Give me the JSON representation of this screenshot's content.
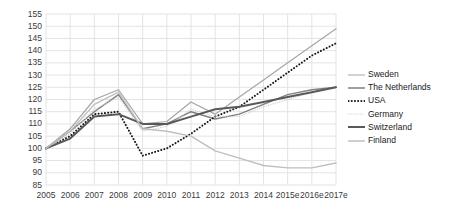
{
  "chart_data": {
    "type": "line",
    "title": "",
    "xlabel": "",
    "ylabel": "",
    "grid": true,
    "legend_position": "right",
    "ylim": [
      85,
      155
    ],
    "ytick_step": 5,
    "yticks": [
      155,
      150,
      145,
      140,
      135,
      130,
      125,
      120,
      115,
      110,
      105,
      100,
      95,
      90,
      85
    ],
    "categories": [
      "2005",
      "2006",
      "2007",
      "2008",
      "2009",
      "2010",
      "2011",
      "2012",
      "2013",
      "2014",
      "2015e",
      "2016e",
      "2017e"
    ],
    "series": [
      {
        "name": "Sweden",
        "color": "#a6a6a6",
        "style": "solid",
        "width": 1.2,
        "values": [
          100,
          108,
          120,
          124,
          110,
          111,
          119,
          114,
          121,
          128,
          135,
          142,
          149
        ]
      },
      {
        "name": "The Netherlands",
        "color": "#808080",
        "style": "solid",
        "width": 1.4,
        "values": [
          100,
          107,
          115,
          122,
          108,
          110,
          115,
          112,
          114,
          118,
          122,
          124,
          125
        ]
      },
      {
        "name": "USA",
        "color": "#1a1a1a",
        "style": "dotted",
        "width": 2.0,
        "values": [
          100,
          105,
          114,
          115,
          97,
          100,
          106,
          113,
          117,
          124,
          131,
          138,
          143
        ]
      },
      {
        "name": "Germany",
        "color": "#c9c9c9",
        "style": "dotted",
        "width": 1.2,
        "values": [
          100,
          106,
          116,
          121,
          107,
          109,
          116,
          113,
          113,
          117,
          120,
          123,
          125
        ]
      },
      {
        "name": "Switzerland",
        "color": "#595959",
        "style": "solid",
        "width": 2.0,
        "values": [
          100,
          104,
          113,
          114,
          110,
          110,
          113,
          116,
          117,
          119,
          121,
          123,
          125
        ]
      },
      {
        "name": "Finland",
        "color": "#bfbfbf",
        "style": "solid",
        "width": 1.4,
        "values": [
          100,
          107,
          118,
          123,
          108,
          107,
          105,
          99,
          96,
          93,
          92,
          92,
          94
        ]
      }
    ]
  },
  "legend": {
    "items": [
      {
        "label": "Sweden"
      },
      {
        "label": "The Netherlands"
      },
      {
        "label": "USA"
      },
      {
        "label": "Germany"
      },
      {
        "label": "Switzerland"
      },
      {
        "label": "Finland"
      }
    ]
  },
  "colors": {
    "grid": "#e3e3e3",
    "axis_text": "#3b3b3b",
    "legend_text": "#1a1a1a",
    "background": "#ffffff"
  }
}
